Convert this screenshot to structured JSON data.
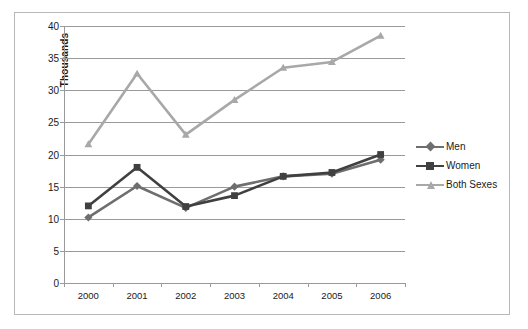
{
  "chart_data": {
    "type": "line",
    "title": "",
    "xlabel": "",
    "ylabel": "Thousands",
    "categories": [
      "2000",
      "2001",
      "2002",
      "2003",
      "2004",
      "2005",
      "2006"
    ],
    "x": [
      2000,
      2001,
      2002,
      2003,
      2004,
      2005,
      2006
    ],
    "ylim": [
      0,
      40
    ],
    "yticks": [
      0,
      5,
      10,
      15,
      20,
      25,
      30,
      35,
      40
    ],
    "ytick_labels": [
      "0",
      "5",
      "10",
      "15",
      "20",
      "25",
      "30",
      "35",
      "40"
    ],
    "grid": true,
    "legend_position": "right",
    "series": [
      {
        "name": "Men",
        "color": "#6e6e6e",
        "marker": "diamond",
        "values": [
          10.2,
          15.1,
          11.7,
          15.0,
          16.6,
          17.0,
          19.2
        ]
      },
      {
        "name": "Women",
        "color": "#404040",
        "marker": "square",
        "values": [
          12.0,
          18.0,
          11.9,
          13.6,
          16.6,
          17.2,
          20.0
        ]
      },
      {
        "name": "Both Sexes",
        "color": "#a8a8a8",
        "marker": "triangle",
        "values": [
          21.6,
          32.6,
          23.1,
          28.5,
          33.5,
          34.4,
          38.5
        ]
      }
    ]
  },
  "legend": {
    "items": [
      {
        "label": "Men"
      },
      {
        "label": "Women"
      },
      {
        "label": "Both Sexes"
      }
    ]
  },
  "axis": {
    "y_title": "Thousands"
  }
}
